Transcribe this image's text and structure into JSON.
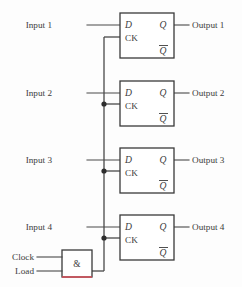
{
  "diagram": {
    "type": "logic-circuit-schematic",
    "background_color": "#fdfdfd",
    "wire_color": "#4a4a4a",
    "box_stroke_color": "#3a3a3a",
    "accent_color": "#d4505a",
    "text_color": "#3c3c3c"
  },
  "inputs": [
    {
      "label": "Input 1",
      "x": 52,
      "y": 25
    },
    {
      "label": "Input 2",
      "x": 52,
      "y": 93
    },
    {
      "label": "Input 3",
      "x": 52,
      "y": 160
    },
    {
      "label": "Input 4",
      "x": 52,
      "y": 227
    }
  ],
  "outputs": [
    {
      "label": "Output 1",
      "x": 192,
      "y": 25
    },
    {
      "label": "Output 2",
      "x": 192,
      "y": 93
    },
    {
      "label": "Output 3",
      "x": 192,
      "y": 160
    },
    {
      "label": "Output 4",
      "x": 192,
      "y": 227
    }
  ],
  "control_inputs": [
    {
      "label": "Clock",
      "x": 10,
      "y": 257
    },
    {
      "label": "Load",
      "x": 10,
      "y": 272
    }
  ],
  "gate": {
    "symbol": "&",
    "name": "and-gate",
    "x": 62,
    "y": 250,
    "width": 30,
    "height": 27
  },
  "flipflops": [
    {
      "name": "flip-flop-1",
      "x": 120,
      "y": 13,
      "width": 54,
      "height": 45,
      "pins": {
        "d": "D",
        "ck": "CK",
        "q": "Q",
        "qbar": "Q"
      }
    },
    {
      "name": "flip-flop-2",
      "x": 120,
      "y": 81,
      "width": 54,
      "height": 45,
      "pins": {
        "d": "D",
        "ck": "CK",
        "q": "Q",
        "qbar": "Q"
      }
    },
    {
      "name": "flip-flop-3",
      "x": 120,
      "y": 148,
      "width": 54,
      "height": 45,
      "pins": {
        "d": "D",
        "ck": "CK",
        "q": "Q",
        "qbar": "Q"
      }
    },
    {
      "name": "flip-flop-4",
      "x": 120,
      "y": 215,
      "width": 54,
      "height": 45,
      "pins": {
        "d": "D",
        "ck": "CK",
        "q": "Q",
        "qbar": "Q"
      }
    }
  ],
  "clock_bus": {
    "name": "clock-distribution-bus",
    "x": 104,
    "top_y": 37,
    "bottom_y": 271,
    "junctions": [
      {
        "x": 104,
        "y": 104
      },
      {
        "x": 104,
        "y": 171
      },
      {
        "x": 104,
        "y": 238
      }
    ]
  }
}
